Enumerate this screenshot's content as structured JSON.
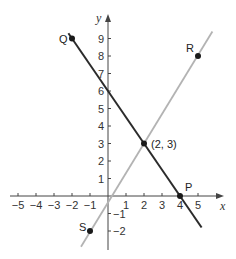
{
  "chart_data": {
    "type": "line",
    "title": "",
    "xlabel": "x",
    "ylabel": "y",
    "xlim": [
      -5,
      5
    ],
    "ylim": [
      -2,
      9
    ],
    "x_ticks": [
      -5,
      -4,
      -3,
      -2,
      -1,
      1,
      2,
      3,
      4,
      5
    ],
    "y_ticks": [
      -2,
      -1,
      1,
      2,
      3,
      4,
      5,
      6,
      7,
      8,
      9
    ],
    "x_tick_labels": [
      "−5",
      "−4",
      "−3",
      "−2",
      "−1",
      "1",
      "2",
      "3",
      "4",
      "5"
    ],
    "y_tick_labels": [
      "−2",
      "−1",
      "1",
      "2",
      "3",
      "4",
      "5",
      "6",
      "7",
      "8",
      "9"
    ],
    "grid": false,
    "series": [
      {
        "name": "line QP",
        "color": "#2b2b2b",
        "points": [
          [
            -2,
            9
          ],
          [
            2,
            3
          ],
          [
            4,
            0
          ]
        ],
        "equation": "y = -1.5x + 6"
      },
      {
        "name": "line SR",
        "color": "#b3b3b3",
        "points": [
          [
            -1,
            -2
          ],
          [
            2,
            3
          ],
          [
            5,
            8
          ]
        ],
        "equation": "y = (5/3)x - 1/3"
      }
    ],
    "labeled_points": [
      {
        "label": "Q",
        "x": -2,
        "y": 9
      },
      {
        "label": "R",
        "x": 5,
        "y": 8
      },
      {
        "label": "P",
        "x": 4,
        "y": 0
      },
      {
        "label": "S",
        "x": -1,
        "y": -2
      },
      {
        "label": "(2, 3)",
        "x": 2,
        "y": 3
      }
    ]
  }
}
